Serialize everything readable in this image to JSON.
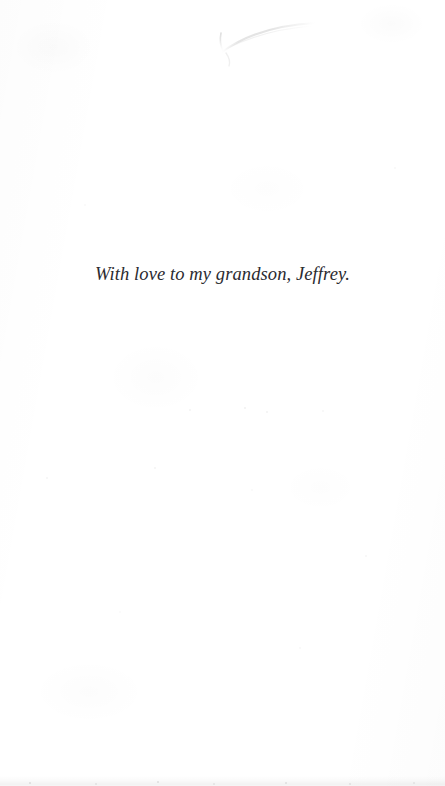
{
  "page": {
    "kind": "book-dedication-page",
    "width": 445,
    "height": 786,
    "background_color": "#ffffff",
    "ink_color": "#2b2b30"
  },
  "dedication": {
    "text": "With love to my grandson, Jeffrey.",
    "alignment": "center",
    "style": "italic-serif"
  },
  "artifacts": {
    "top_arc": {
      "name": "scan-curve-artifact",
      "color": "#dedede"
    },
    "bottom_edge": {
      "name": "scan-edge-band",
      "color": "#e6e6e6"
    },
    "paper_grain": {
      "name": "paper-grain",
      "color": "#f7f7f7"
    }
  }
}
